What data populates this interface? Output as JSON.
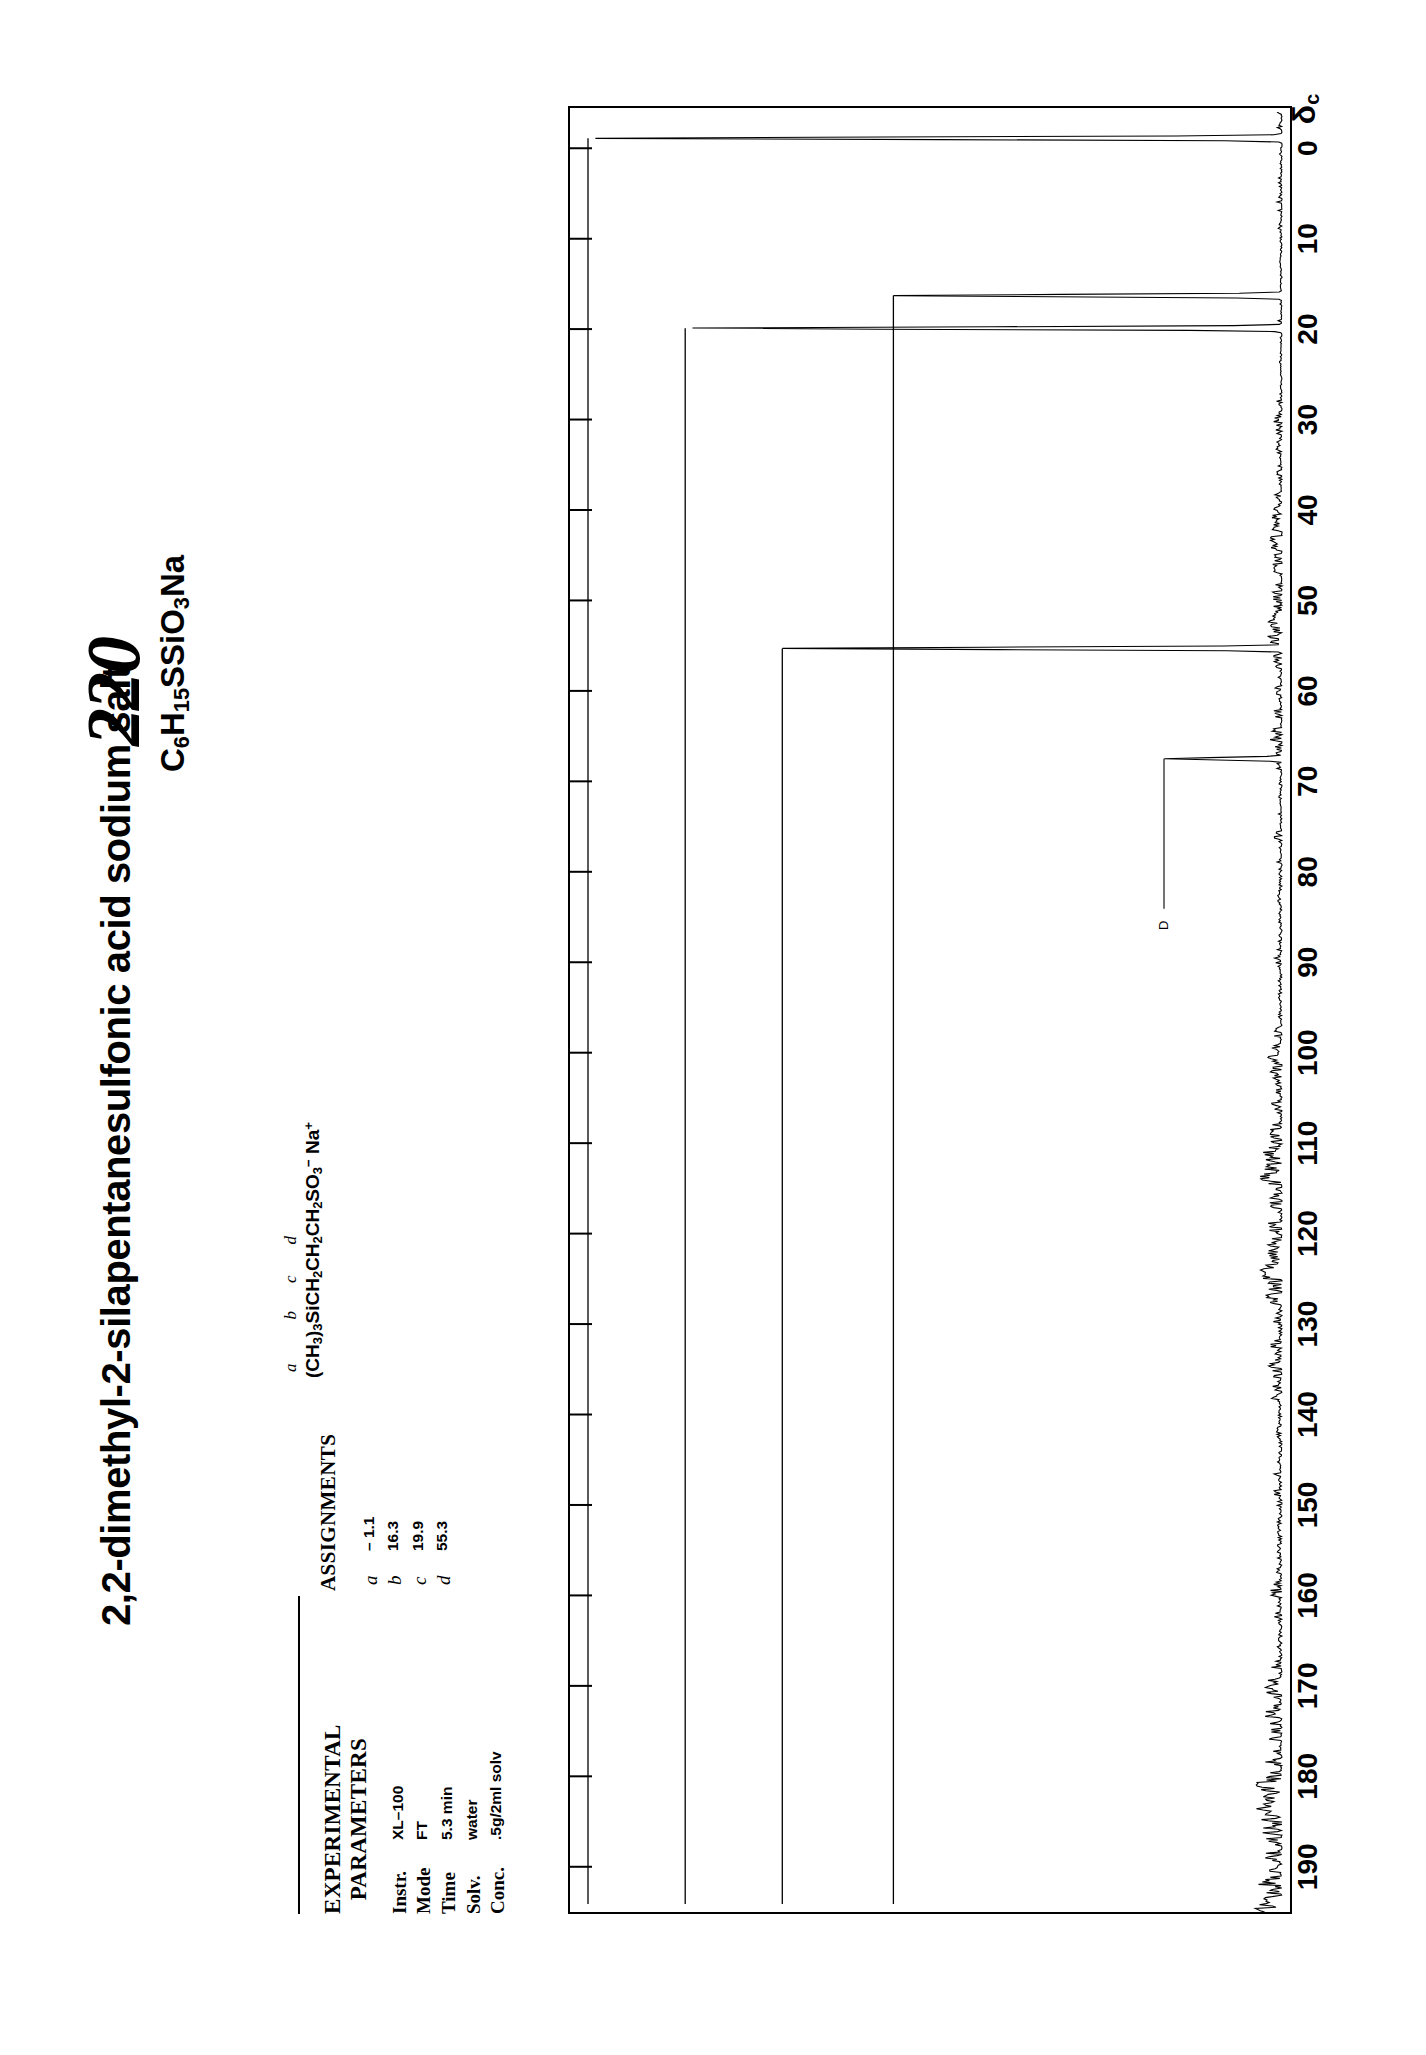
{
  "catalog_number": "220",
  "title": "2,2-dimethyl-2-silapentanesulfonic acid sodium salt",
  "molecular_formula": "C6H15SSiO3Na",
  "structure": {
    "letters_line": "a            b   c   d",
    "formula_line": "(CH3)3SiCH2CH2CH2SO3− Na+"
  },
  "experimental": {
    "heading_line1": "EXPERIMENTAL",
    "heading_line2": "PARAMETERS",
    "rows": [
      {
        "key": "Instr.",
        "value": "XL–100"
      },
      {
        "key": "Mode",
        "value": "FT"
      },
      {
        "key": "Time",
        "value": "5.3 min"
      },
      {
        "key": "Solv.",
        "value": "water"
      },
      {
        "key": "Conc.",
        "value": ".5g/2ml solv"
      }
    ]
  },
  "assignments": {
    "heading": "ASSIGNMENTS",
    "rows": [
      {
        "key": "a",
        "value": "– 1.1"
      },
      {
        "key": "b",
        "value": "16.3"
      },
      {
        "key": "c",
        "value": "19.9"
      },
      {
        "key": "d",
        "value": "55.3"
      }
    ]
  },
  "chart_data": {
    "type": "line",
    "xlabel": "δc",
    "ylabel": "",
    "xlim": [
      195,
      -4
    ],
    "x_ticks": [
      0,
      10,
      20,
      30,
      40,
      50,
      60,
      70,
      80,
      90,
      100,
      110,
      120,
      130,
      140,
      150,
      160,
      170,
      180,
      190
    ],
    "x_tick_labels": [
      "0",
      "10",
      "20",
      "30",
      "40",
      "50",
      "60",
      "70",
      "80",
      "90",
      "100",
      "110",
      "120",
      "130",
      "140",
      "150",
      "160",
      "170",
      "180",
      "190"
    ],
    "grid": false,
    "legend": null,
    "annotations": [
      {
        "text": "D",
        "x": 67.5,
        "note": "dioxane reference peak"
      }
    ],
    "peaks": [
      {
        "ppm": -1.1,
        "rel_height": 1.0,
        "assignment": "a"
      },
      {
        "ppm": 16.3,
        "rel_height": 0.56,
        "assignment": "b"
      },
      {
        "ppm": 19.9,
        "rel_height": 0.86,
        "assignment": "c"
      },
      {
        "ppm": 55.3,
        "rel_height": 0.72,
        "assignment": "d"
      },
      {
        "ppm": 67.5,
        "rel_height": 0.17,
        "assignment": "D"
      }
    ],
    "baseline_noise": true
  },
  "axis": {
    "delta_symbol": "δ",
    "delta_subscript": "c"
  }
}
